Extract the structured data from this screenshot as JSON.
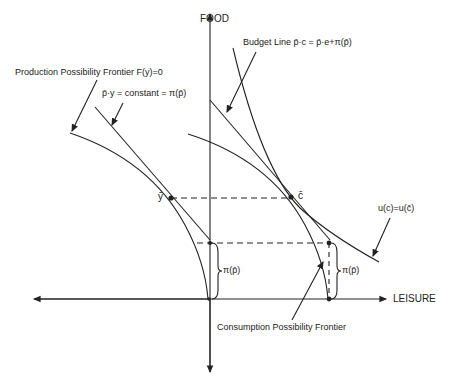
{
  "axes": {
    "y_label": "FOOD",
    "x_label": "LEISURE"
  },
  "labels": {
    "ppf": "Production Possibility Frontier  F(y)=0",
    "isoprofit": "p̄·y = constant = π(p̄)",
    "budget": "Budget Line  p̄·c = p̄·e+π(p̄)",
    "indifference": "u(c)=u(c̄)",
    "cpf": "Consumption Possibility Frontier",
    "y_bar": "ȳ",
    "c_bar": "c̄",
    "pi_left": "π(p̄)",
    "pi_right": "π(p̄)"
  },
  "colors": {
    "ink": "#222222",
    "background": "#ffffff"
  }
}
